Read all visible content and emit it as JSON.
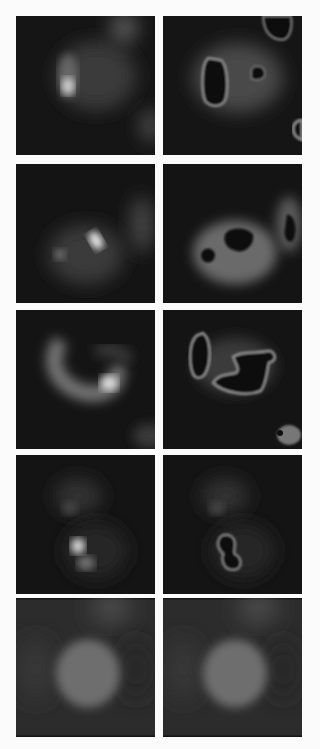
{
  "figure": {
    "rows": [
      {
        "index": 1,
        "left": "raw cell with bright spot at left",
        "right": "segmented: large dark region, small dark blob, edge regions"
      },
      {
        "index": 2,
        "left": "raw cell with bright central spot",
        "right": "segmented: dark pentagon region, small dark dot, right edge object"
      },
      {
        "index": 3,
        "left": "raw curved/ring-shaped cell",
        "right": "segmented: outlined bean and hook-shaped dark regions"
      },
      {
        "index": 4,
        "left": "raw cell with two bright spots lower",
        "right": "segmented: dumbbell-shaped outlined dark region"
      },
      {
        "index": 5,
        "left": "raw round diffuse cell",
        "right": "unchanged round diffuse cell"
      }
    ],
    "colors": {
      "background": "#fbfbfb",
      "panel": "#141414",
      "rim": "#8a8a8a"
    }
  }
}
